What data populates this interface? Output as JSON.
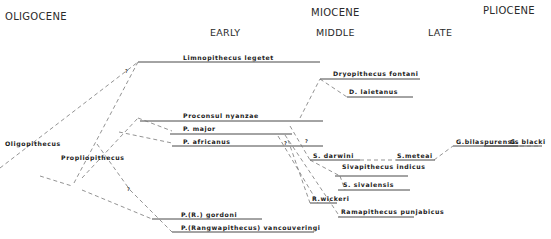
{
  "epochs": {
    "oligocene": "OLIGOCENE",
    "miocene": "MIOCENE",
    "pliocene": "PLIOCENE"
  },
  "subdivisions": {
    "early": "EARLY",
    "middle": "MIDDLE",
    "late": "LATE"
  },
  "taxa": {
    "limnopithecus": "Limnopithecus legetet",
    "dryopithecus_fontani": "Dryopithecus fontani",
    "d_laietanus": "D. laietanus",
    "proconsul_nyanzae": "Proconsul nyanzae",
    "p_major": "P. major",
    "p_africanus": "P. africanus",
    "oligopithecus": "Oligopithecus",
    "propliopithecus": "Propliopithecus",
    "s_darwini": "S. darwini",
    "s_meteai": "S.meteai",
    "g_bilaspurensis": "G.bilaspurensis",
    "g_blacki": "G. blacki",
    "sivapithecus_indicus": "Sivapithecus indicus",
    "s_sivalensis": "S. sivalensis",
    "r_wickeri": "R.wickeri",
    "ramapithecus": "Ramapithecus punjabicus",
    "p_r_gordoni": "P.(R.) gordoni",
    "p_vancouveringi": "P.(Rangwapithecus) vancouveringi"
  },
  "uncertainty_marks": {
    "q1": "?",
    "q2": "?",
    "q3": "?",
    "q4": "?"
  }
}
